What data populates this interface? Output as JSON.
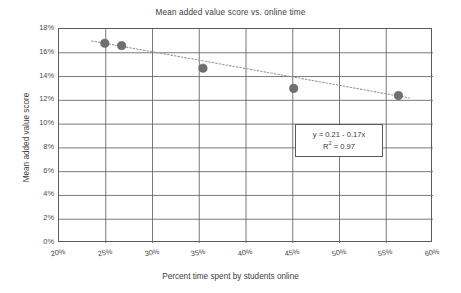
{
  "chart_data": {
    "type": "scatter",
    "title": "Mean added value score vs. online time",
    "xlabel": "Percent time spent by students online",
    "ylabel": "Mean added value score",
    "xlim": [
      20,
      60
    ],
    "ylim": [
      0,
      18
    ],
    "xticks": [
      "20%",
      "25%",
      "30%",
      "35%",
      "40%",
      "45%",
      "50%",
      "55%",
      "60%"
    ],
    "xtick_values": [
      20,
      25,
      30,
      35,
      40,
      45,
      50,
      55,
      60
    ],
    "yticks": [
      "0%",
      "2%",
      "4%",
      "6%",
      "8%",
      "10%",
      "12%",
      "14%",
      "16%",
      "18%"
    ],
    "ytick_values": [
      0,
      2,
      4,
      6,
      8,
      10,
      12,
      14,
      16,
      18
    ],
    "grid": true,
    "legend": "none",
    "series": [
      {
        "name": "Schools",
        "marker": "filled-circle",
        "color": "#707070",
        "points": [
          {
            "x": 24.9,
            "y": 16.8
          },
          {
            "x": 26.7,
            "y": 16.6
          },
          {
            "x": 35.4,
            "y": 14.7
          },
          {
            "x": 45.1,
            "y": 13.0
          },
          {
            "x": 56.3,
            "y": 12.4
          }
        ]
      }
    ],
    "trendline": {
      "name": "Linear trendline",
      "style": "dotted",
      "color": "#9a9a9a",
      "equation": "y = 0.21 - 0.17x",
      "r_squared_label": "R",
      "r_squared_exponent": "2",
      "r_squared_value": " = 0.97",
      "x_start": 23.5,
      "y_start": 17.0,
      "x_end": 57.5,
      "y_end": 12.2
    },
    "annotation": {
      "line1": "y = 0.21 - 0.17x",
      "line2_base": "R",
      "line2_sup": "2",
      "line2_rest": " = 0.97"
    }
  },
  "colors": {
    "axis": "#5a5a5a",
    "grid": "#6a6a6a",
    "marker": "#707070",
    "trend": "#9a9a9a",
    "text": "#404040",
    "background": "#ffffff"
  }
}
